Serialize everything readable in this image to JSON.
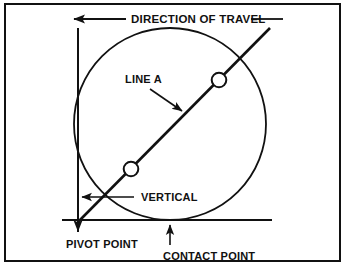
{
  "figure": {
    "kind": "technical-line-diagram",
    "title": "DIRECTION OF TRAVEL",
    "background_color": "#ffffff",
    "ink_color": "#111111",
    "border": {
      "color": "#111111",
      "width_px": 2
    }
  },
  "labels": {
    "direction_of_travel": "DIRECTION OF TRAVEL",
    "line_a": "LINE A",
    "vertical": "VERTICAL",
    "pivot_point": "PIVOT POINT",
    "contact_point": "CONTACT POINT"
  },
  "geometry": {
    "vertical_axis": {
      "x": 78,
      "y_top": 28,
      "y_bottom": 232
    },
    "horizontal_axis": {
      "y": 220,
      "x_left": 62,
      "x_right": 272
    },
    "circle": {
      "cx": 170,
      "cy": 124,
      "r": 96,
      "fill": "none"
    },
    "line_a": {
      "x1": 78,
      "y1": 222,
      "x2": 270,
      "y2": 28
    },
    "markers": [
      {
        "name": "upper-marker",
        "cx": 219,
        "cy": 80,
        "r": 7.5,
        "fill": "#ffffff"
      },
      {
        "name": "lower-marker",
        "cx": 131,
        "cy": 169,
        "r": 7.5,
        "fill": "#ffffff"
      }
    ],
    "pivot_point": {
      "x": 78,
      "y": 222
    },
    "contact_point": {
      "x": 170,
      "y": 220
    }
  },
  "leaders": {
    "direction_of_travel_left": {
      "x1": 126,
      "y1": 19,
      "x2": 72,
      "y2": 19,
      "arrow": "left"
    },
    "direction_of_travel_right": {
      "x1": 251,
      "y1": 19,
      "x2": 283,
      "y2": 19,
      "arrow": "none"
    },
    "line_a_arrow": {
      "x1": 150,
      "y1": 89,
      "x2": 184,
      "y2": 113,
      "arrow": "end"
    },
    "vertical_leader": {
      "x1": 131,
      "y1": 197,
      "x2": 81,
      "y2": 197,
      "arrow": "left"
    },
    "contact_point_arrow": {
      "x1": 170,
      "y1": 243,
      "x2": 170,
      "y2": 224,
      "arrow": "up"
    },
    "pivot_point_arrow": {
      "x1": 78,
      "y1": 212,
      "x2": 78,
      "y2": 232,
      "arrow": "down"
    }
  },
  "label_positions": {
    "direction_of_travel": {
      "x": 131,
      "y": 23
    },
    "line_a": {
      "x": 125,
      "y": 83
    },
    "vertical": {
      "x": 139,
      "y": 201
    },
    "pivot_point": {
      "x": 66,
      "y": 247
    },
    "contact_point": {
      "x": 163,
      "y": 259
    }
  }
}
